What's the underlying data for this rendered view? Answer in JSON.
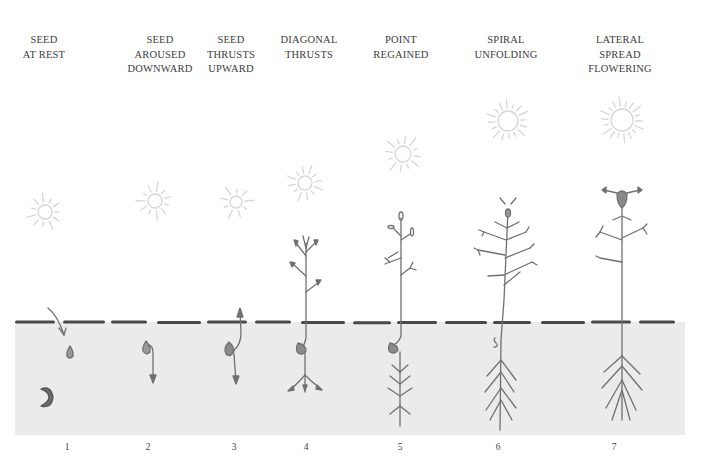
{
  "figure": {
    "colors": {
      "background": "#ffffff",
      "soil": "#ebebeb",
      "soil_line": "#4a4a4a",
      "plant": "#707070",
      "sun": "#d6d6d6",
      "text": "#3c3c3c"
    },
    "soil": {
      "x": 15,
      "y": 322,
      "width": 670,
      "height": 113
    },
    "stages": [
      {
        "number": "1",
        "label": "SEED\nAT REST",
        "x": 44,
        "sun": {
          "x": 45,
          "y": 212,
          "r": 7,
          "rays": 11
        }
      },
      {
        "number": "2",
        "label": "SEED\nAROUSED\nDOWNWARD",
        "x": 160,
        "sun": {
          "x": 155,
          "y": 201,
          "r": 7,
          "rays": 11
        }
      },
      {
        "number": "3",
        "label": "SEED\nTHRUSTS\nUPWARD",
        "x": 231,
        "sun": {
          "x": 236,
          "y": 202,
          "r": 6,
          "rays": 9
        }
      },
      {
        "number": "4",
        "label": "DIAGONAL\nTHRUSTS",
        "x": 309,
        "sun": {
          "x": 305,
          "y": 183,
          "r": 7,
          "rays": 12
        }
      },
      {
        "number": "5",
        "label": "POINT\nREGAINED",
        "x": 401,
        "sun": {
          "x": 403,
          "y": 154,
          "r": 8,
          "rays": 12
        }
      },
      {
        "number": "6",
        "label": "SPIRAL\nUNFOLDING",
        "x": 506,
        "sun": {
          "x": 508,
          "y": 121,
          "r": 10,
          "rays": 16
        }
      },
      {
        "number": "7",
        "label": "LATERAL\nSPREAD\nFLOWERING",
        "x": 620,
        "sun": {
          "x": 622,
          "y": 120,
          "r": 11,
          "rays": 18
        }
      }
    ]
  }
}
